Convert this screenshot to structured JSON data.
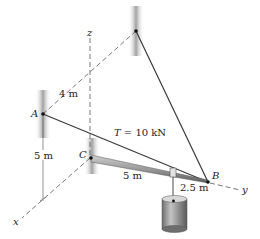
{
  "diagram": {
    "type": "3D statics problem figure",
    "axes": {
      "x_label": "x",
      "y_label": "y",
      "z_label": "z"
    },
    "points": {
      "A": "A",
      "B": "B",
      "C": "C"
    },
    "dimensions": {
      "A_offset": "4 m",
      "height": "5 m",
      "rod_CB_segment": "5 m",
      "rod_end_segment": "2.5 m"
    },
    "tension_label": "T = 10 kN",
    "tension_symbol": "T",
    "tension_value": " = 10 kN",
    "colors": {
      "line": "#333333",
      "dashed_axis": "#555555",
      "wall_shade": "#9a9a9a",
      "rod": "#8c8c8c",
      "cylinder": "#8a8a8a",
      "text": "#222222"
    }
  }
}
